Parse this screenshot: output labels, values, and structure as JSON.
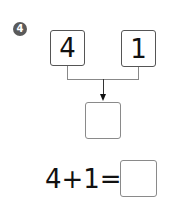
{
  "problem": {
    "number": "4",
    "top_left_value": "4",
    "top_right_value": "1",
    "result_box_value": "",
    "equation": "4+1=",
    "answer_box_value": ""
  }
}
